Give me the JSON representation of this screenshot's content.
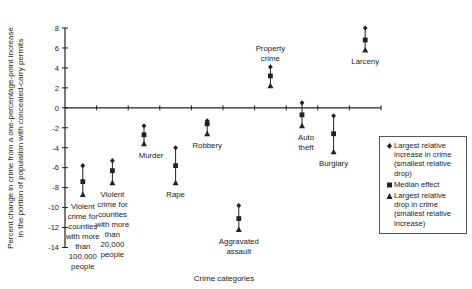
{
  "chart_data": {
    "type": "scatter",
    "subtype": "range-markers",
    "title": "",
    "xlabel": "Crime categories",
    "ylabel": "Percent change in crime from a one-percentage-point increase in the portion of population with concealed-carry permits",
    "ylabel_lines": [
      "Percent change in crime from a one-percentage-point increase",
      "in the portion of population with concealed-carry permits"
    ],
    "ylim": [
      -14,
      8
    ],
    "yticks": [
      8,
      6,
      4,
      2,
      0,
      -2,
      -4,
      -6,
      -8,
      -10,
      -12,
      -14
    ],
    "grid": false,
    "legend_position": "right",
    "categories": [
      "Violent crime for counties with more than 100,000 people",
      "Violent crime for counties with more than 20,000 people",
      "Murder",
      "Rape",
      "Robbery",
      "Aggravated assault",
      "Property crime",
      "Auto theft",
      "Burglary",
      "Larceny"
    ],
    "series": [
      {
        "name": "Largest relative increase in crime (smallest relative drop)",
        "marker": "diamond",
        "values": [
          -5.8,
          -5.3,
          -1.8,
          -4.0,
          -1.3,
          -9.8,
          4.1,
          0.5,
          -0.8,
          8.0
        ]
      },
      {
        "name": "Median effect",
        "marker": "square",
        "values": [
          -7.4,
          -6.3,
          -2.7,
          -5.8,
          -1.6,
          -11.1,
          3.2,
          -0.7,
          -2.6,
          6.8
        ]
      },
      {
        "name": "Largest relative drop in crime (smallest relative increase)",
        "marker": "triangle",
        "values": [
          -8.7,
          -7.5,
          -3.6,
          -7.5,
          -2.6,
          -12.2,
          2.2,
          -1.8,
          -4.4,
          5.8
        ]
      }
    ]
  },
  "labels": {
    "category_lines": [
      [
        "Violent",
        "crime for",
        "counties",
        "with more",
        "than",
        "100,000",
        "people"
      ],
      [
        "Violent",
        "crime for",
        "counties",
        "with more",
        "than",
        "20,000",
        "people"
      ],
      [
        "Murder"
      ],
      [
        "Rape"
      ],
      [
        "Robbery"
      ],
      [
        "Aggravated",
        "assault"
      ],
      [
        "Property",
        "crime"
      ],
      [
        "Auto",
        "theft"
      ],
      [
        "Burglary"
      ],
      [
        "Larceny"
      ]
    ]
  },
  "legend": {
    "items": [
      {
        "marker": "diamond",
        "label": "Largest relative increase in crime (smallest relative drop)"
      },
      {
        "marker": "square",
        "label": "Median effect"
      },
      {
        "marker": "triangle",
        "label": "Largest relative drop in crime (smallest relative increase)"
      }
    ]
  }
}
